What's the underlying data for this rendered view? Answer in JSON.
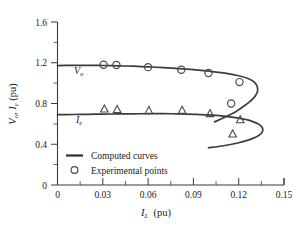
{
  "chart_data": {
    "type": "line",
    "title": "",
    "subtitle": "",
    "xlabel": "I_L  (pu)",
    "xlabel_main": "I",
    "xlabel_sub": "L",
    "xlabel_unit": "(pu)",
    "ylabel": "V_o, I_e  (pu)",
    "ylabel_part1": "V",
    "ylabel_sub1": "o",
    "ylabel_part2": ", I",
    "ylabel_sub2": "e",
    "ylabel_unit": "(pu)",
    "xlim": [
      0,
      0.15
    ],
    "ylim": [
      0,
      1.6
    ],
    "xticks": [
      0,
      0.03,
      0.06,
      0.09,
      0.12,
      0.15
    ],
    "xticklabels": [
      "0",
      "0.03",
      "0.06",
      "0.09",
      "0.12",
      "0.15"
    ],
    "yticks": [
      0,
      0.4,
      0.8,
      1.2,
      1.6
    ],
    "yticklabels": [
      "0",
      "0.4",
      "0.8",
      "1.2",
      "1.6"
    ],
    "minor_x_ticks": [
      0.015,
      0.045,
      0.075,
      0.105,
      0.135
    ],
    "minor_y_ticks": [
      0.2,
      0.6,
      1.0,
      1.4
    ],
    "grid": false,
    "legend_position": "lower-left-inside",
    "series": [
      {
        "name": "V_o computed curve",
        "label": "V",
        "label_sub": "o",
        "type": "computed",
        "marker": "none",
        "upper_branch": [
          [
            0.0,
            1.172
          ],
          [
            0.01,
            1.174
          ],
          [
            0.02,
            1.175
          ],
          [
            0.03,
            1.173
          ],
          [
            0.04,
            1.17
          ],
          [
            0.05,
            1.166
          ],
          [
            0.06,
            1.16
          ],
          [
            0.07,
            1.152
          ],
          [
            0.08,
            1.143
          ],
          [
            0.09,
            1.132
          ],
          [
            0.1,
            1.118
          ],
          [
            0.11,
            1.1
          ],
          [
            0.12,
            1.072
          ],
          [
            0.127,
            1.04
          ],
          [
            0.131,
            1.0
          ],
          [
            0.1325,
            0.95
          ],
          [
            0.132,
            0.9
          ],
          [
            0.129,
            0.84
          ],
          [
            0.124,
            0.78
          ],
          [
            0.118,
            0.72
          ],
          [
            0.11,
            0.66
          ],
          [
            0.104,
            0.62
          ]
        ]
      },
      {
        "name": "I_e computed curve",
        "label": "I",
        "label_sub": "e",
        "type": "computed",
        "marker": "none",
        "lower_branch": [
          [
            0.0,
            0.69
          ],
          [
            0.01,
            0.692
          ],
          [
            0.02,
            0.694
          ],
          [
            0.03,
            0.696
          ],
          [
            0.04,
            0.698
          ],
          [
            0.05,
            0.699
          ],
          [
            0.06,
            0.7
          ],
          [
            0.07,
            0.7
          ],
          [
            0.08,
            0.698
          ],
          [
            0.09,
            0.694
          ],
          [
            0.1,
            0.688
          ],
          [
            0.11,
            0.676
          ],
          [
            0.12,
            0.656
          ],
          [
            0.128,
            0.63
          ],
          [
            0.134,
            0.59
          ],
          [
            0.136,
            0.545
          ],
          [
            0.1345,
            0.5
          ],
          [
            0.129,
            0.455
          ],
          [
            0.12,
            0.415
          ],
          [
            0.11,
            0.385
          ],
          [
            0.1,
            0.365
          ]
        ]
      },
      {
        "name": "V_o experimental points",
        "type": "experimental",
        "marker": "circle",
        "points": [
          [
            0.0305,
            1.18
          ],
          [
            0.039,
            1.178
          ],
          [
            0.06,
            1.157
          ],
          [
            0.082,
            1.132
          ],
          [
            0.1,
            1.1
          ],
          [
            0.1205,
            1.01
          ],
          [
            0.115,
            0.8
          ]
        ]
      },
      {
        "name": "I_e experimental points",
        "type": "experimental",
        "marker": "triangle",
        "points": [
          [
            0.031,
            0.745
          ],
          [
            0.0395,
            0.74
          ],
          [
            0.0605,
            0.73
          ],
          [
            0.0825,
            0.733
          ],
          [
            0.101,
            0.7
          ],
          [
            0.121,
            0.64
          ],
          [
            0.116,
            0.5
          ]
        ]
      }
    ],
    "legend": [
      {
        "marker": "line",
        "label": "Computed curves"
      },
      {
        "marker": "circle",
        "label": "Experimental points"
      }
    ],
    "annotations": [
      {
        "text": "V",
        "sub": "o",
        "x": 0.012,
        "y": 1.06,
        "name": "curve-label-vo"
      },
      {
        "text": "I",
        "sub": "e",
        "x": 0.014,
        "y": 0.575,
        "name": "curve-label-ie"
      }
    ],
    "colors": {
      "curve": "#3d3d3d",
      "axis": "#3a3a3a",
      "marker": "#4a4a4a",
      "background": "#ffffff"
    }
  }
}
